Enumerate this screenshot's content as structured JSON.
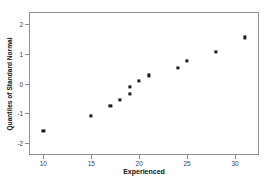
{
  "chart_data": {
    "type": "scatter",
    "title": "",
    "xlabel": "Experienced",
    "ylabel": "Quantiles of Standard Normal",
    "xlim": [
      8.5,
      32.5
    ],
    "ylim": [
      -2.4,
      2.4
    ],
    "xticks": [
      10,
      15,
      20,
      25,
      30
    ],
    "xtick_labels": [
      "10",
      "15",
      "20",
      "25",
      "30"
    ],
    "yticks": [
      2,
      1,
      0,
      -1,
      -2
    ],
    "ytick_labels": [
      "2",
      "1",
      "0",
      "-1",
      "-2"
    ],
    "grid": false,
    "legend": null,
    "marker": "square",
    "marker_color": "#1a1a1a",
    "frame_color": "#8f8f8f",
    "x": [
      10,
      15,
      17,
      18,
      19,
      19,
      20,
      21,
      24,
      25,
      28,
      31
    ],
    "y": [
      -1.59,
      -1.1,
      -0.76,
      -0.54,
      -0.35,
      -0.12,
      0.1,
      0.27,
      0.51,
      0.75,
      1.07,
      1.55
    ],
    "points": [
      {
        "x": 10,
        "y": -1.59
      },
      {
        "x": 15,
        "y": -1.1
      },
      {
        "x": 17,
        "y": -0.76
      },
      {
        "x": 18,
        "y": -0.54
      },
      {
        "x": 19,
        "y": -0.35
      },
      {
        "x": 19,
        "y": -0.12
      },
      {
        "x": 20,
        "y": 0.1
      },
      {
        "x": 21,
        "y": 0.27
      },
      {
        "x": 24,
        "y": 0.51
      },
      {
        "x": 25,
        "y": 0.75
      },
      {
        "x": 28,
        "y": 1.07
      },
      {
        "x": 31,
        "y": 1.55
      }
    ]
  }
}
